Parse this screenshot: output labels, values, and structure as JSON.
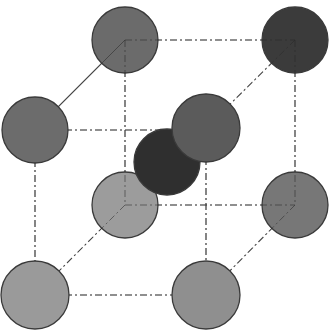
{
  "diagram": {
    "type": "body-centered-cubic-unit-cell",
    "width": 332,
    "height": 333,
    "edge_color": "#6e6e6e",
    "outline_color": "#3a3a3a",
    "atoms": [
      {
        "id": "back-top-left",
        "cx": 125,
        "cy": 40,
        "r": 33,
        "fill": "#6b6b6b",
        "layer": "back"
      },
      {
        "id": "back-top-right",
        "cx": 295,
        "cy": 40,
        "r": 33,
        "fill": "#3b3b3b",
        "layer": "back"
      },
      {
        "id": "back-bottom-left",
        "cx": 125,
        "cy": 205,
        "r": 33,
        "fill": "#9c9c9c",
        "layer": "back"
      },
      {
        "id": "back-bottom-right",
        "cx": 295,
        "cy": 205,
        "r": 33,
        "fill": "#777777",
        "layer": "back"
      },
      {
        "id": "body-center",
        "cx": 167,
        "cy": 162,
        "r": 33,
        "fill": "#2f2f2f",
        "layer": "center"
      },
      {
        "id": "front-top-left",
        "cx": 35,
        "cy": 130,
        "r": 33,
        "fill": "#6c6c6c",
        "layer": "front"
      },
      {
        "id": "front-top-right",
        "cx": 206,
        "cy": 128,
        "r": 34,
        "fill": "#5b5b5b",
        "layer": "front"
      },
      {
        "id": "front-bottom-left",
        "cx": 35,
        "cy": 295,
        "r": 34,
        "fill": "#9a9a9a",
        "layer": "front"
      },
      {
        "id": "front-bottom-right",
        "cx": 206,
        "cy": 295,
        "r": 34,
        "fill": "#8f8f8f",
        "layer": "front"
      }
    ],
    "edges": [
      {
        "id": "back-top",
        "x1": 125,
        "y1": 40,
        "x2": 295,
        "y2": 40,
        "style": "dashdot"
      },
      {
        "id": "back-left",
        "x1": 125,
        "y1": 40,
        "x2": 125,
        "y2": 205,
        "style": "dashdot"
      },
      {
        "id": "back-right",
        "x1": 295,
        "y1": 40,
        "x2": 295,
        "y2": 205,
        "style": "dashdot"
      },
      {
        "id": "back-bottom",
        "x1": 125,
        "y1": 205,
        "x2": 295,
        "y2": 205,
        "style": "dashdot"
      },
      {
        "id": "top-left-depth",
        "x1": 125,
        "y1": 40,
        "x2": 35,
        "y2": 130,
        "style": "solid"
      },
      {
        "id": "top-right-depth",
        "x1": 295,
        "y1": 40,
        "x2": 206,
        "y2": 128,
        "style": "dashdot"
      },
      {
        "id": "bottom-left-depth",
        "x1": 125,
        "y1": 205,
        "x2": 35,
        "y2": 295,
        "style": "dashdot"
      },
      {
        "id": "bottom-right-depth",
        "x1": 295,
        "y1": 205,
        "x2": 206,
        "y2": 295,
        "style": "dashdot"
      },
      {
        "id": "front-top",
        "x1": 35,
        "y1": 130,
        "x2": 206,
        "y2": 130,
        "style": "dashdot"
      },
      {
        "id": "front-left",
        "x1": 35,
        "y1": 130,
        "x2": 35,
        "y2": 295,
        "style": "dashdot"
      },
      {
        "id": "front-right",
        "x1": 206,
        "y1": 128,
        "x2": 206,
        "y2": 295,
        "style": "dashdot"
      },
      {
        "id": "front-bottom",
        "x1": 35,
        "y1": 295,
        "x2": 206,
        "y2": 295,
        "style": "dashdot"
      }
    ]
  }
}
